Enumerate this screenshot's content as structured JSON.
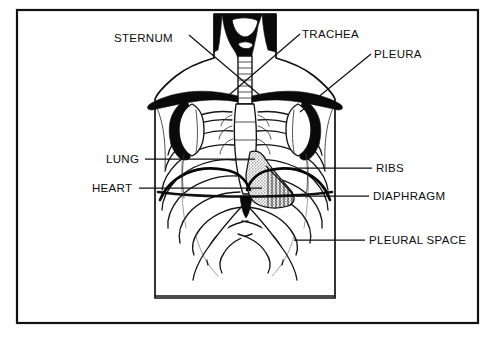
{
  "figure": {
    "view": "anterior",
    "style": "line-drawing",
    "border_color": "#111111",
    "ink_color": "#0d0d0d",
    "paper_color": "#ffffff",
    "heart_shade_color": "#9a9a9a",
    "label_font_size": "11.5px"
  },
  "labels": [
    {
      "id": "sternum",
      "text": "STERNUM",
      "text_x": 114,
      "text_y": 42,
      "anchor": "start",
      "leader": "M 189 35 L 262 97",
      "side": "left"
    },
    {
      "id": "trachea",
      "text": "TRACHEA",
      "text_x": 302,
      "text_y": 38,
      "anchor": "start",
      "leader": "M 300 34 L 229 95",
      "side": "right"
    },
    {
      "id": "pleura",
      "text": "PLEURA",
      "text_x": 374,
      "text_y": 58,
      "anchor": "start",
      "leader": "M 371 54 L 300 112",
      "side": "right"
    },
    {
      "id": "lung",
      "text": "LUNG",
      "text_x": 106,
      "text_y": 163,
      "anchor": "start",
      "leader": "M 145 159 L 255 159",
      "side": "left"
    },
    {
      "id": "heart",
      "text": "HEART",
      "text_x": 92,
      "text_y": 192,
      "anchor": "start",
      "leader": "M 139 188 L 262 188",
      "side": "left"
    },
    {
      "id": "ribs",
      "text": "RIBS",
      "text_x": 376,
      "text_y": 172,
      "anchor": "start",
      "leader": "M 372 168 L 298 168",
      "side": "right"
    },
    {
      "id": "diaphragm",
      "text": "DIAPHRAGM",
      "text_x": 373,
      "text_y": 200,
      "anchor": "start",
      "leader": "M 369 196 L 296 196",
      "side": "right"
    },
    {
      "id": "pleural-space",
      "text": "PLEURAL SPACE",
      "text_x": 369,
      "text_y": 244,
      "anchor": "start",
      "leader": "M 365 240 L 294 240",
      "side": "right"
    }
  ],
  "frame": {
    "x": 17,
    "y": 10,
    "width": 461,
    "height": 313
  }
}
